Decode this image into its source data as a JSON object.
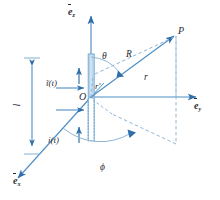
{
  "figure": {
    "kind": "antenna-coordinate-diagram",
    "colors": {
      "line": "#4e8fc4",
      "dark_line": "#2f6ea8",
      "dash": "#8fb6d6",
      "fill_light": "#cfe3f2",
      "arrow": "#2f6ea8",
      "text": "#2b2b33",
      "background": "#ffffff"
    }
  },
  "axes": {
    "z": {
      "label": "e",
      "subscript": "z",
      "name": "unit-vector-ez"
    },
    "y": {
      "label": "e",
      "subscript": "y",
      "name": "unit-vector-ey"
    },
    "x": {
      "label": "e",
      "subscript": "x",
      "name": "unit-vector-ex"
    }
  },
  "points": {
    "origin": {
      "label": "O"
    },
    "field_point": {
      "label": "P"
    }
  },
  "angles": {
    "theta": {
      "label": "θ"
    },
    "phi": {
      "label": "ϕ"
    }
  },
  "lengths": {
    "r_source": {
      "label": "r′"
    },
    "R": {
      "label": "R"
    },
    "r": {
      "label": "r"
    },
    "antenna_length": {
      "label": "l"
    }
  },
  "currents": {
    "upper": {
      "label": "ĩ(t)",
      "base": "i",
      "arg": "(t)",
      "name": "current-phasor-upper"
    },
    "lower": {
      "label": "i(t)",
      "base": "i",
      "arg": "(t)",
      "name": "current-lower"
    }
  }
}
